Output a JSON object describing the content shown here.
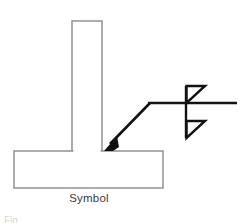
{
  "figure": {
    "caption": "Symbol",
    "partial_bottom_text": "Fig",
    "colors": {
      "joint_outline": "#8a8a8a",
      "symbol_line": "#121212",
      "background": "#ffffff",
      "caption_text": "#3a3a3a"
    },
    "joint": {
      "type": "tee-joint",
      "vertical_member": {
        "x": 72,
        "y": 21,
        "width": 30,
        "height": 131
      },
      "base_plate": {
        "x": 14,
        "y": 151,
        "width": 149,
        "height": 37
      }
    },
    "leader": {
      "arrow_tip_x": 105,
      "arrow_tip_y": 150,
      "bend_x": 150,
      "bend_y": 103,
      "arrowhead": "solid-filled-arrow"
    },
    "reference_line": {
      "x1": 148,
      "x2": 237,
      "y": 103
    },
    "weld_symbol": {
      "name": "double-fillet-weld",
      "vertical_line_x": 186,
      "vertical_line_y1": 86,
      "vertical_line_y2": 138,
      "arrow_side_triangle": {
        "apex_x": 205,
        "top_y": 86,
        "base_y": 103
      },
      "other_side_triangle": {
        "apex_x": 205,
        "top_y": 121,
        "base_y": 138
      }
    }
  }
}
